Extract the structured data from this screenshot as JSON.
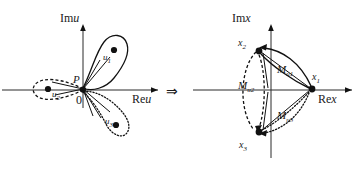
{
  "figure": {
    "type": "diagram",
    "transition_arrow": "⇒"
  },
  "left_plane": {
    "name": "u-plane",
    "axis_imaginary_label": "Im",
    "axis_imaginary_var": "u",
    "axis_real_label": "Re",
    "axis_real_var": "u",
    "origin_label": "0",
    "point_label": "P",
    "petals": [
      {
        "label_base": "u",
        "label_sub": "1",
        "style": "solid",
        "direction": "upper-right"
      },
      {
        "label_base": "u",
        "label_sub": "2",
        "style": "dash-dot",
        "direction": "left"
      },
      {
        "label_base": "u",
        "label_sub": "3",
        "style": "dotted",
        "direction": "lower-right"
      }
    ]
  },
  "right_plane": {
    "name": "x-plane",
    "axis_imaginary_label": "Im",
    "axis_imaginary_var": "x",
    "axis_real_label": "Re",
    "axis_real_var": "x",
    "points": [
      {
        "label_base": "x",
        "label_sub": "1",
        "position": "right"
      },
      {
        "label_base": "x",
        "label_sub": "2",
        "position": "upper-left"
      },
      {
        "label_base": "x",
        "label_sub": "3",
        "position": "lower-left"
      }
    ],
    "monodromy_labels": [
      {
        "label_base": "M",
        "label_sub": "u",
        "label_sub2": "1",
        "style": "solid"
      },
      {
        "label_base": "M",
        "label_sub": "u",
        "label_sub2": "2",
        "style": "dash-dot"
      },
      {
        "label_base": "M",
        "label_sub": "u",
        "label_sub2": "3",
        "style": "dotted"
      }
    ]
  },
  "colors": {
    "ink": "#111111",
    "axis": "#2b2b2b",
    "background": "#ffffff"
  }
}
